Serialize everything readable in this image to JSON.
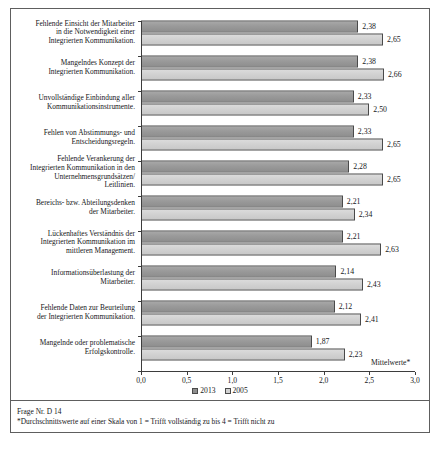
{
  "figure": {
    "axis_unit_label": "Mittelwerte*",
    "footnote_line1": "Frage Nr. D 14",
    "footnote_line2": "*Durchschnittswerte auf einer Skala von 1 = Trifft vollständig zu bis 4 = Trifft nicht zu",
    "colors": {
      "series_2013": "#8e8e8e",
      "series_2005": "#d2d2d2",
      "border": "#5e5e5e",
      "axis": "#3d3d3d",
      "text": "#16181a"
    }
  },
  "chart_data": {
    "type": "bar",
    "orientation": "horizontal",
    "title": "",
    "subtitle": "",
    "xlabel": "Mittelwerte*",
    "ylabel": "",
    "xlim": [
      0,
      3
    ],
    "xticks": [
      "0,0",
      "0,5",
      "1,0",
      "1,5",
      "2,0",
      "2,5",
      "3,0"
    ],
    "xtick_values": [
      0,
      0.5,
      1,
      1.5,
      2,
      2.5,
      3
    ],
    "grid": false,
    "legend_position": "bottom-center",
    "legend": [
      "2013",
      "2005"
    ],
    "categories": [
      "Fehlende Einsicht der Mitarbeiter in die Notwendigkeit einer Integrierten Kommunikation.",
      "Mangelndes Konzept der Integrierten Kommunikation.",
      "Unvollständige Einbindung aller Kommunikationsinstrumente.",
      "Fehlen von Abstimmungs- und Entscheidungsregeln.",
      "Fehlende Verankerung der Integrierten Kommunikation in den Unternehmensgrundsätzen/ Leitlinien.",
      "Bereichs- bzw. Abteilungsdenken der Mitarbeiter.",
      "Lückenhaftes Verständnis der Integrierten Kommunikation im mittleren Management.",
      "Informationsüberlastung der Mitarbeiter.",
      "Fehlende Daten zur Beurteilung der Integrierten Kommunikation.",
      "Mangelnde oder problematische Erfolgskontrolle."
    ],
    "category_lines": [
      [
        "Fehlende Einsicht der Mitarbeiter",
        "in die Notwendigkeit einer",
        "Integrierten Kommunikation."
      ],
      [
        "Mangelndes Konzept der",
        "Integrierten Kommunikation."
      ],
      [
        "Unvollständige Einbindung aller",
        "Kommunikationsinstrumente."
      ],
      [
        "Fehlen von Abstimmungs- und",
        "Entscheidungsregeln."
      ],
      [
        "Fehlende Verankerung der",
        "Integrierten Kommunikation in den",
        "Unternehmensgrundsätzen/",
        "Leitlinien."
      ],
      [
        "Bereichs- bzw. Abteilungsdenken",
        "der Mitarbeiter."
      ],
      [
        "Lückenhaftes Verständnis der",
        "Integrierten Kommunikation im",
        "mittleren Management."
      ],
      [
        "Informationsüberlastung der",
        "Mitarbeiter."
      ],
      [
        "Fehlende Daten zur Beurteilung",
        "der Integrierten Kommunikation."
      ],
      [
        "Mangelnde oder problematische",
        "Erfolgskontrolle."
      ]
    ],
    "series": [
      {
        "name": "2013",
        "values": [
          2.38,
          2.38,
          2.33,
          2.33,
          2.28,
          2.21,
          2.21,
          2.14,
          2.12,
          1.87
        ],
        "labels": [
          "2,38",
          "2,38",
          "2,33",
          "2,33",
          "2,28",
          "2,21",
          "2,21",
          "2,14",
          "2,12",
          "1,87"
        ]
      },
      {
        "name": "2005",
        "values": [
          2.65,
          2.66,
          2.5,
          2.65,
          2.65,
          2.34,
          2.63,
          2.43,
          2.41,
          2.23
        ],
        "labels": [
          "2,65",
          "2,66",
          "2,50",
          "2,65",
          "2,65",
          "2,34",
          "2,63",
          "2,43",
          "2,41",
          "2,23"
        ]
      }
    ]
  }
}
